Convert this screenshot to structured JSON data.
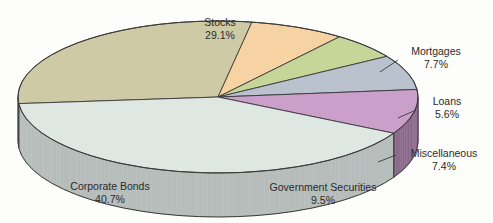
{
  "chart_data": {
    "type": "pie",
    "title": "",
    "subtitle": "",
    "xlabel": "",
    "ylabel": "",
    "legend_position": "none",
    "labels_inline": true,
    "three_d": true,
    "categories": [
      "Stocks",
      "Mortgages",
      "Loans",
      "Miscellaneous",
      "Government Securities",
      "Corporate Bonds"
    ],
    "values": [
      29.1,
      7.7,
      5.6,
      7.4,
      9.5,
      40.7
    ],
    "unit": "%",
    "slices": [
      {
        "label": "Stocks",
        "value": 29.1,
        "value_text": "29.1%",
        "color": "#cfcaa6",
        "side_color": "#a8a486"
      },
      {
        "label": "Mortgages",
        "value": 7.7,
        "value_text": "7.7%",
        "color": "#f7d3a4",
        "side_color": "#cdae85"
      },
      {
        "label": "Loans",
        "value": 5.6,
        "value_text": "5.6%",
        "color": "#c5d698",
        "side_color": "#9aa977"
      },
      {
        "label": "Miscellaneous",
        "value": 7.4,
        "value_text": "7.4%",
        "color": "#b9c2cd",
        "side_color": "#8b919b"
      },
      {
        "label": "Government Securities",
        "value": 9.5,
        "value_text": "9.5%",
        "color": "#caa0ca",
        "side_color": "#8c6b8c"
      },
      {
        "label": "Corporate Bonds",
        "value": 40.7,
        "value_text": "40.7%",
        "color": "#dfe7e3",
        "side_color": "#b6bdbb"
      }
    ]
  },
  "labels": {
    "stocks": {
      "name": "Stocks",
      "pct": "29.1%"
    },
    "mortgages": {
      "name": "Mortgages",
      "pct": "7.7%"
    },
    "loans": {
      "name": "Loans",
      "pct": "5.6%"
    },
    "misc": {
      "name": "Miscellaneous",
      "pct": "7.4%"
    },
    "govt": {
      "name": "Government Securities",
      "pct": "9.5%"
    },
    "bonds": {
      "name": "Corporate Bonds",
      "pct": "40.7%"
    }
  },
  "colors": {
    "background": "#fdfdfb",
    "outline": "#3a3a3a",
    "text": "#2b2b2b"
  }
}
